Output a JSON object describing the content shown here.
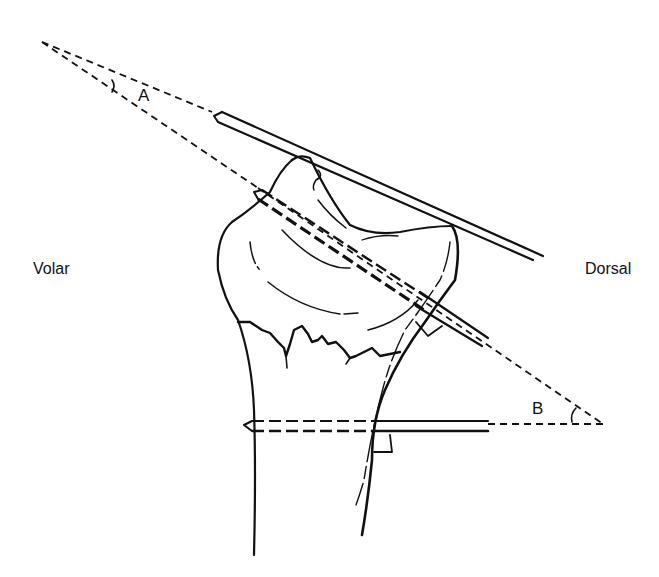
{
  "diagram": {
    "labels": {
      "left_side": "Volar",
      "right_side": "Dorsal",
      "angle_a": "A",
      "angle_b": "B"
    },
    "colors": {
      "ink": "#111111",
      "background": "#ffffff"
    },
    "elements": [
      "distal-radius-bone",
      "fracture-line",
      "upper-k-wire",
      "middle-k-wire",
      "lower-k-wire",
      "angle-a-lines",
      "angle-b-lines",
      "right-angle-markers"
    ]
  }
}
